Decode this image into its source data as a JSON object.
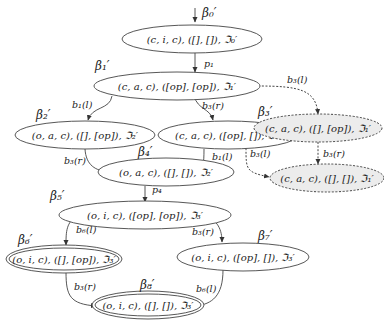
{
  "diagram": {
    "nodes": [
      {
        "id": "n0",
        "beta": "β₀′",
        "label": "(c, i, c), ([], []), ℑ₀′",
        "style": "solid"
      },
      {
        "id": "n1",
        "beta": "β₁′",
        "label": "(c, a, c), ([op], [op]), ℑ₁′",
        "style": "solid"
      },
      {
        "id": "n2",
        "beta": "β₂′",
        "label": "(o, a, c), ([], [op]), ℑ₂′",
        "style": "solid"
      },
      {
        "id": "n3",
        "beta": "β₃′",
        "label": "(c, a, c), ([op], []), ℑ₁′",
        "style": "solid"
      },
      {
        "id": "nA",
        "beta": "",
        "label": "(c, a, c), ([], [op]), ℑ₁′",
        "style": "dashed-shaded"
      },
      {
        "id": "n4",
        "beta": "β₄′",
        "label": "(o, a, c), ([], []), ℑ₂′",
        "style": "solid"
      },
      {
        "id": "nB",
        "beta": "",
        "label": "(c, a, c), ([], []), ℑ₁′",
        "style": "dashed-shaded"
      },
      {
        "id": "n5",
        "beta": "β₅′",
        "label": "(o, i, c), ([op], [op]), ℑ₃′",
        "style": "solid"
      },
      {
        "id": "n6",
        "beta": "β₆′",
        "label": "(o, i, c), ([], [op]), ℑ₃′",
        "style": "double"
      },
      {
        "id": "n7",
        "beta": "β₇′",
        "label": "(o, i, c), ([op], []), ℑ₃′",
        "style": "solid"
      },
      {
        "id": "n8",
        "beta": "β₈′",
        "label": "(o, i, c), ([], []), ℑ₃′",
        "style": "double"
      }
    ],
    "edges": [
      {
        "from": "start",
        "to": "n0",
        "label": "",
        "style": "solid"
      },
      {
        "from": "n0",
        "to": "n1",
        "label": "p₁",
        "style": "solid"
      },
      {
        "from": "n1",
        "to": "n2",
        "label": "b₁(l)",
        "style": "solid"
      },
      {
        "from": "n1",
        "to": "n3",
        "label": "b₃(r)",
        "style": "solid"
      },
      {
        "from": "n1",
        "to": "nA",
        "label": "b₃(l)",
        "style": "dashed"
      },
      {
        "from": "n2",
        "to": "n4",
        "label": "b₃(r)",
        "style": "solid"
      },
      {
        "from": "n3",
        "to": "n4",
        "label": "b₁(l)",
        "style": "solid"
      },
      {
        "from": "n3",
        "to": "nB",
        "label": "b₃(l)",
        "style": "dashed"
      },
      {
        "from": "nA",
        "to": "nB",
        "label": "b₃(r)",
        "style": "dashed"
      },
      {
        "from": "n4",
        "to": "n5",
        "label": "p₄",
        "style": "solid"
      },
      {
        "from": "n5",
        "to": "n6",
        "label": "b₆(l)",
        "style": "solid"
      },
      {
        "from": "n5",
        "to": "n7",
        "label": "b₃(r)",
        "style": "solid"
      },
      {
        "from": "n6",
        "to": "n8",
        "label": "b₃(r)",
        "style": "solid"
      },
      {
        "from": "n7",
        "to": "n8",
        "label": "b₆(l)",
        "style": "solid"
      }
    ]
  }
}
